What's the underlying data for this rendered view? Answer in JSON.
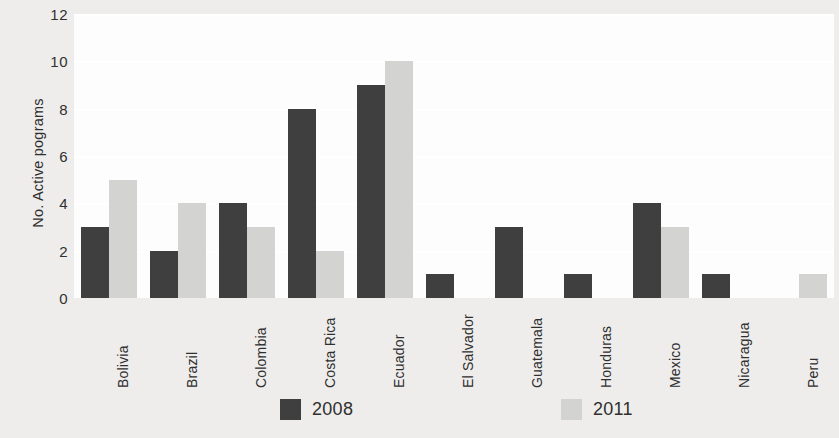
{
  "chart_data": {
    "type": "bar",
    "title": "",
    "subtitle": "",
    "xlabel": "",
    "ylabel": "No. Active pograms",
    "ylim": [
      0,
      12
    ],
    "ytick_labels": [
      "12",
      "10",
      "8",
      "6",
      "4",
      "2",
      "0"
    ],
    "ytick_values": [
      12,
      10,
      8,
      6,
      4,
      2,
      0
    ],
    "grid": true,
    "grid_axis": "y",
    "legend_position": "bottom",
    "categories": [
      "Bolivia",
      "Brazil",
      "Colombia",
      "Costa Rica",
      "Ecuador",
      "El Salvador",
      "Guatemala",
      "Honduras",
      "Mexico",
      "Nicaragua",
      "Peru"
    ],
    "series": [
      {
        "name": "2008",
        "color": "#403f3f",
        "values": [
          3,
          2,
          4,
          8,
          9,
          1,
          3,
          1,
          4,
          1,
          0
        ]
      },
      {
        "name": "2011",
        "color": "#d3d3d1",
        "values": [
          5,
          4,
          3,
          2,
          10,
          0,
          0,
          0,
          3,
          0,
          1
        ]
      }
    ]
  },
  "legend": {
    "items": [
      {
        "label": "2008",
        "series_key": "s2008"
      },
      {
        "label": "2011",
        "series_key": "s2011"
      }
    ]
  },
  "colors": {
    "series_2008": "#403f3f",
    "series_2011": "#d3d3d1",
    "page_background": "#eeedeb",
    "plot_background": "#fdfdfd",
    "gridline": "#ffffff",
    "text": "#2f2f2f"
  }
}
